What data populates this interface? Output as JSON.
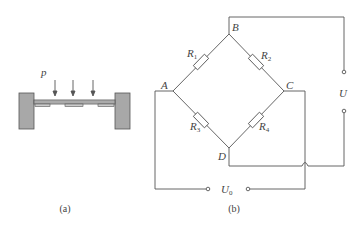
{
  "panel_a": {
    "pressure_label": "p",
    "caption": "(a)",
    "arrow_count": 3,
    "strain_gauge_count": 3
  },
  "panel_b": {
    "caption": "(b)",
    "nodes": {
      "A": "A",
      "B": "B",
      "C": "C",
      "D": "D"
    },
    "resistors": [
      {
        "name": "R",
        "sub": "1"
      },
      {
        "name": "R",
        "sub": "2"
      },
      {
        "name": "R",
        "sub": "3"
      },
      {
        "name": "R",
        "sub": "4"
      }
    ],
    "supply_label": "U",
    "output_label": {
      "name": "U",
      "sub": "0"
    }
  },
  "colors": {
    "line": "#555555",
    "support_fill": "#a8a8a8",
    "text": "#444444"
  }
}
